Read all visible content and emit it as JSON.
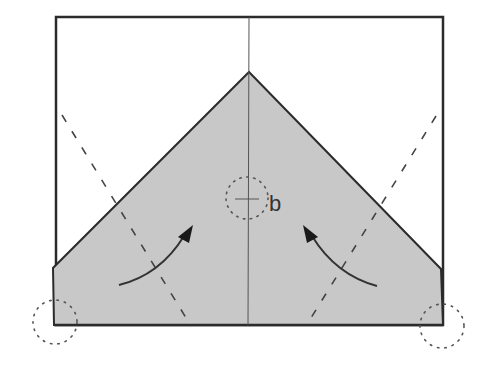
{
  "diagram": {
    "type": "origami-fold-instruction",
    "label": "b",
    "colors": {
      "paper_fill": "#c8c8c8",
      "outline": "#2b2b2b",
      "crease": "#555555",
      "dashed_fold": "#444444",
      "dotted_marker": "#555555",
      "arrow": "#333333",
      "background": "#ffffff"
    },
    "elements": {
      "outer_square": "Square sheet outline",
      "center_crease": "Vertical center crease line",
      "folded_shape": "Shaded folded paper (pentagon/house shape)",
      "valley_fold_left": "Dashed fold line on left",
      "valley_fold_right": "Dashed fold line on right",
      "arrow_left": "Curved fold arrow pointing up-right",
      "arrow_right": "Curved fold arrow pointing up-left",
      "reference_circle_center": "Dotted circle marking reference point b",
      "reference_circle_left_corner": "Dotted circle at bottom-left corner",
      "reference_circle_right_corner": "Dotted circle at bottom-right corner"
    }
  }
}
